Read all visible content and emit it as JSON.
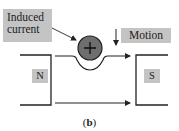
{
  "labels": {
    "induced_current": "Induced current",
    "motion": "Motion",
    "north": "N",
    "south": "S",
    "conductor_symbol": "+"
  },
  "caption": {
    "open": "(",
    "letter": "b",
    "close": ")"
  },
  "colors": {
    "label_bg": "#c4c4c4",
    "conductor_fill": "#6e6e6e",
    "line": "#222222"
  }
}
